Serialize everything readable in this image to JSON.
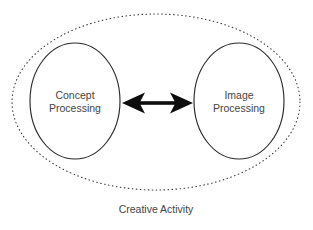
{
  "diagram": {
    "title": "Creative Activity",
    "type": "venn-boundary-bidirectional",
    "background_color": "#ffffff",
    "text_color": "#444444",
    "stroke_color": "#2b2b2b",
    "arrow_color": "#0d0d0d",
    "boundary": {
      "name": "Creative Activity",
      "style": "dotted-ellipse",
      "stroke_color": "#3a3a3a",
      "cx": 156,
      "cy": 102,
      "rx": 144,
      "ry": 88
    },
    "caption": {
      "text": "Creative Activity",
      "x": 156,
      "y": 213
    },
    "nodes": [
      {
        "id": "concept-processing",
        "label_line1": "Concept",
        "label_line2": "Processing",
        "cx": 75,
        "cy": 101,
        "rx": 45,
        "ry": 58
      },
      {
        "id": "image-processing",
        "label_line1": "Image",
        "label_line2": "Processing",
        "cx": 239,
        "cy": 101,
        "rx": 45,
        "ry": 58
      }
    ],
    "connector": {
      "id": "concept-image-link",
      "style": "double-headed-arrow",
      "direction": "bidirectional",
      "from": "concept-processing",
      "to": "image-processing",
      "x_start": 122,
      "x_end": 193,
      "y": 103,
      "label": ""
    }
  }
}
